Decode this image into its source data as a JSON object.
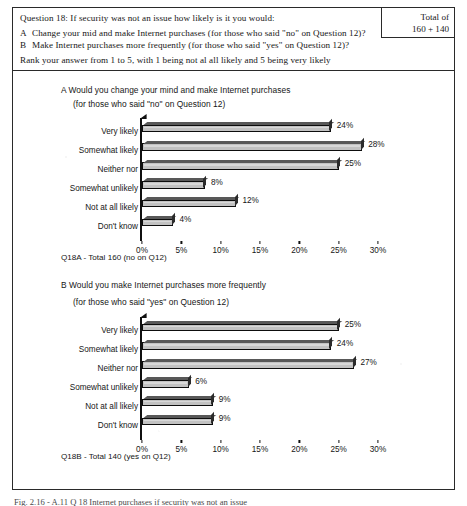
{
  "header": {
    "question_line": "Question 18: If security was not an issue how likely is it you would:",
    "option_a_mark": "A",
    "option_a_text": "Change your mid and make Internet purchases (for those who said \"no\" on Question 12)?",
    "option_b_mark": "B",
    "option_b_text": "Make Internet purchases more frequently (for those who said \"yes\" on Question 12)?",
    "rank_instruction": "Rank your answer from 1 to 5, with 1 being not al all likely and 5 being very likely",
    "total_label": "Total of",
    "total_value": "160 + 140"
  },
  "bottom_note": "Fig. 2.16 - A.11 Q 18 Internet purchases if security was not an issue",
  "chart_data": [
    {
      "id": "chart-a",
      "type": "bar",
      "orientation": "horizontal",
      "title_line1": "A  Would you change your mind and make Internet purchases",
      "title_line2": "(for those who said \"no\" on Question 12)",
      "caption": "Q18A - Total 160 (no on Q12)",
      "categories": [
        "Very likely",
        "Somewhat likely",
        "Neither nor",
        "Somewhat unlikely",
        "Not at all likely",
        "Don't know"
      ],
      "values": [
        24,
        28,
        25,
        8,
        12,
        4
      ],
      "data_labels": [
        "24%",
        "28%",
        "25%",
        "8%",
        "12%",
        "4%"
      ],
      "xlabel": "",
      "ylabel": "",
      "xlim": [
        0,
        30
      ],
      "xticks": [
        0,
        5,
        10,
        15,
        20,
        25,
        30
      ],
      "xtick_labels": [
        "0%",
        "5%",
        "10%",
        "15%",
        "20%",
        "25%",
        "30%"
      ],
      "grid": false,
      "legend": false,
      "bar_color": "#c2c2c2",
      "bar_edge_color": "#0d0d0d"
    },
    {
      "id": "chart-b",
      "type": "bar",
      "orientation": "horizontal",
      "title_line1": "B  Would you make Internet purchases more frequently",
      "title_line2": "(for those who said \"yes\" on Question 12)",
      "caption": "Q18B - Total 140 (yes on Q12)",
      "categories": [
        "Very likely",
        "Somewhat likely",
        "Neither nor",
        "Somewhat unlikely",
        "Not at all likely",
        "Don't know"
      ],
      "values": [
        25,
        24,
        27,
        6,
        9,
        9
      ],
      "data_labels": [
        "25%",
        "24%",
        "27%",
        "6%",
        "9%",
        "9%"
      ],
      "xlabel": "",
      "ylabel": "",
      "xlim": [
        0,
        30
      ],
      "xticks": [
        0,
        5,
        10,
        15,
        20,
        25,
        30
      ],
      "xtick_labels": [
        "0%",
        "5%",
        "10%",
        "15%",
        "20%",
        "25%",
        "30%"
      ],
      "grid": false,
      "legend": false,
      "bar_color": "#c2c2c2",
      "bar_edge_color": "#0d0d0d"
    }
  ]
}
